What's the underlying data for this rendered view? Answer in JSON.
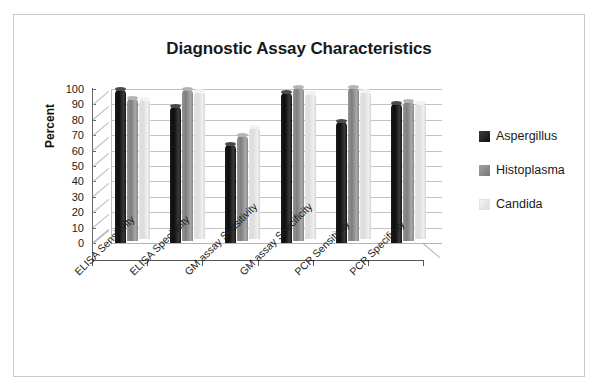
{
  "figure": {
    "border_color": "#c9c9c9",
    "background": "#ffffff"
  },
  "chart_data": {
    "type": "bar",
    "title": "Diagnostic Assay Characteristics",
    "xlabel": "",
    "ylabel": "Percent",
    "ylim": [
      0,
      100
    ],
    "ytick_step": 10,
    "yticks": [
      "100",
      "90",
      "80",
      "70",
      "60",
      "50",
      "40",
      "30",
      "20",
      "10",
      "0"
    ],
    "grid": true,
    "legend_position": "right",
    "style": "3d-cylinder-clustered",
    "categories": [
      "ELISA Sensitivity",
      "ELISA Specificity",
      "GM assay Sensitivity",
      "GM assay Specificity",
      "PCR Sensitivity",
      "PCR Specificity"
    ],
    "series": [
      {
        "name": "Aspergillus",
        "color": "#141414",
        "values": [
          100,
          89,
          64,
          98,
          79,
          91
        ]
      },
      {
        "name": "Histoplasma",
        "color": "#858585",
        "values": [
          93,
          99,
          69,
          100,
          100,
          91
        ]
      },
      {
        "name": "Candida",
        "color": "#e0e0e0",
        "values": [
          91,
          96,
          73,
          95,
          96,
          88
        ]
      }
    ]
  },
  "legend": {
    "entries": [
      {
        "label": "Aspergillus",
        "swatch": "dark"
      },
      {
        "label": "Histoplasma",
        "swatch": "mid"
      },
      {
        "label": "Candida",
        "swatch": "light"
      }
    ]
  }
}
